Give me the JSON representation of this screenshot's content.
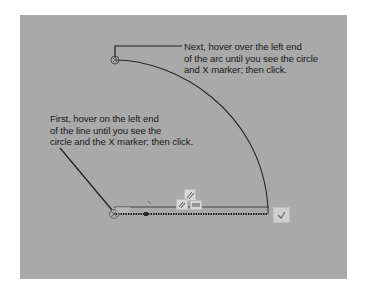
{
  "callouts": {
    "top": {
      "lines": [
        "Next, hover over the left end",
        "of the arc until you see the circle",
        "and X marker; then click."
      ]
    },
    "left": {
      "lines": [
        "First, hover on the left end",
        "of the line until you see the",
        "circle and the X marker; then click."
      ]
    }
  },
  "canvas": {
    "background": "#a9a9a9",
    "stroke_color": "#2a2a2a",
    "arc": {
      "start": [
        115,
        60
      ],
      "end": [
        268,
        208
      ]
    },
    "line": {
      "start": [
        113,
        214
      ],
      "end": [
        268,
        214
      ]
    }
  },
  "icons": {
    "constraint_parallel": "parallel-constraint-icon",
    "constraint_equal": "equal-constraint-icon",
    "constraint_horizontal": "horizontal-constraint-icon",
    "confirm": "check-icon",
    "endpoint_marker": "circle-x-marker-icon"
  }
}
